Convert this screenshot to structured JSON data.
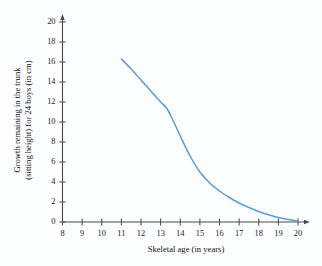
{
  "chart_data": {
    "type": "line",
    "title": "",
    "xlabel": "Skeletal age (in years)",
    "ylabel_line1": "Growth remaining in the trunk",
    "ylabel_line2": "(sitting height) for 24 boys (in cm)",
    "xlim": [
      8,
      20
    ],
    "ylim": [
      0,
      20
    ],
    "xticks": [
      8,
      9,
      10,
      11,
      12,
      13,
      14,
      15,
      16,
      17,
      18,
      19,
      20
    ],
    "yticks": [
      0,
      2,
      4,
      6,
      8,
      10,
      12,
      14,
      16,
      18,
      20
    ],
    "grid": false,
    "legend": "none",
    "series": [
      {
        "name": "Growth remaining",
        "color": "#5b9bd5",
        "x": [
          11.0,
          11.5,
          12.0,
          12.5,
          13.0,
          13.3,
          13.6,
          14.0,
          14.5,
          15.0,
          15.5,
          16.0,
          16.5,
          17.0,
          17.5,
          18.0,
          18.5,
          19.0,
          19.5,
          20.0
        ],
        "y": [
          16.3,
          15.3,
          14.2,
          13.1,
          12.0,
          11.4,
          10.3,
          8.6,
          6.6,
          5.0,
          3.9,
          3.1,
          2.45,
          1.9,
          1.45,
          1.05,
          0.72,
          0.45,
          0.25,
          0.1
        ]
      }
    ],
    "axis_arrow_x": true,
    "axis_arrow_y": true,
    "axis_color": "#4a4a4a",
    "background_color": "#fdfeff"
  },
  "axis": {
    "x_title": "Skeletal age (in years)",
    "y_title_line1": "Growth remaining in the trunk",
    "y_title_line2": "(sitting height) for 24 boys (in cm)"
  }
}
